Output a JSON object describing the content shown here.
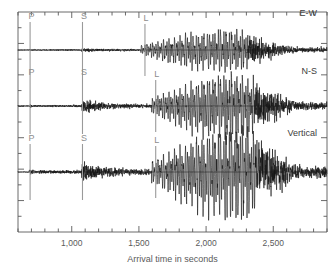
{
  "chart_data": {
    "type": "line",
    "title": "",
    "subtitle": "",
    "xlabel": "Arrival time in seconds",
    "ylabel": "",
    "xlim": [
      600,
      2900
    ],
    "grid": false,
    "legend_position": "none",
    "x_major_ticks": [
      1000,
      1500,
      2000,
      2500
    ],
    "x_major_tick_labels": [
      "1,000",
      "1,500",
      "2,000",
      "2,500"
    ],
    "x_minor_tick_step": 100,
    "y_minor_tick_count": 14,
    "annotations": [
      {
        "label": "P",
        "x": 690,
        "trace": "E-W"
      },
      {
        "label": "S",
        "x": 1080,
        "trace": "E-W"
      },
      {
        "label": "L",
        "x": 1545,
        "trace": "E-W"
      },
      {
        "label": "P",
        "x": 690,
        "trace": "N-S"
      },
      {
        "label": "S",
        "x": 1080,
        "trace": "N-S"
      },
      {
        "label": "L",
        "x": 1625,
        "trace": "N-S"
      },
      {
        "label": "P",
        "x": 690,
        "trace": "Vertical"
      },
      {
        "label": "S",
        "x": 1080,
        "trace": "Vertical"
      },
      {
        "label": "L",
        "x": 1625,
        "trace": "Vertical"
      }
    ],
    "series": [
      {
        "name": "E-W",
        "label": "E-W",
        "baseline_y": 50,
        "p_arrival": 690,
        "s_arrival": 1080,
        "l_arrival": 1545,
        "peak_x": 2080,
        "peak_amplitude": 22,
        "noise_amplitude": 1.2
      },
      {
        "name": "N-S",
        "label": "N-S",
        "baseline_y": 106,
        "p_arrival": 690,
        "s_arrival": 1080,
        "l_arrival": 1625,
        "peak_x": 2130,
        "peak_amplitude": 34,
        "noise_amplitude": 1.5
      },
      {
        "name": "Vertical",
        "label": "Vertical",
        "baseline_y": 172,
        "p_arrival": 690,
        "s_arrival": 1080,
        "l_arrival": 1625,
        "peak_x": 2145,
        "peak_amplitude": 48,
        "noise_amplitude": 2.2
      }
    ]
  },
  "axis": {
    "xlabel": "Arrival time in seconds",
    "tick_labels": [
      "1,000",
      "1,500",
      "2,000",
      "2,500"
    ]
  },
  "traces": {
    "ew": {
      "label": "E-W",
      "p": "P",
      "s": "S",
      "l": "L"
    },
    "ns": {
      "label": "N-S",
      "p": "P",
      "s": "S",
      "l": "L"
    },
    "vertical": {
      "label": "Vertical",
      "p": "P",
      "s": "S",
      "l": "L"
    }
  },
  "colors": {
    "trace": "#151515",
    "axis": "#5a5a5a",
    "phase_marker": "#9a9a9a",
    "phase_label": "#8d8d8d",
    "trace_label": "#3c3c3c",
    "background": "#ffffff"
  }
}
